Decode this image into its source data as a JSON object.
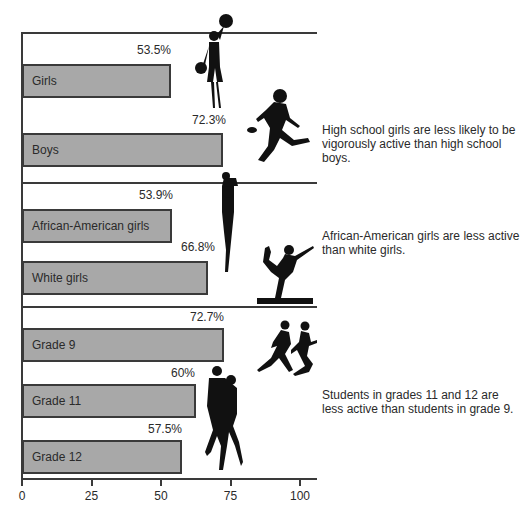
{
  "chart_data": {
    "type": "bar",
    "orientation": "horizontal",
    "title": "",
    "xlabel": "",
    "ylabel": "",
    "xlim": [
      0,
      105
    ],
    "x_ticks": [
      "0",
      "25",
      "50",
      "75",
      "100"
    ],
    "grid": false,
    "groups": [
      {
        "name": "Gender",
        "note": "High school girls are less likely to be vigorously active than high school boys.",
        "categories": [
          "Girls",
          "Boys"
        ],
        "values": [
          53.5,
          72.3
        ],
        "value_labels": [
          "53.5%",
          "72.3%"
        ]
      },
      {
        "name": "Race",
        "note": "African-American girls are less active than white girls.",
        "categories": [
          "African-American girls",
          "White girls"
        ],
        "values": [
          53.9,
          66.8
        ],
        "value_labels": [
          "53.9%",
          "66.8%"
        ]
      },
      {
        "name": "Grade",
        "note": "Students in grades 11 and 12 are less active than students in grade 9.",
        "categories": [
          "Grade 9",
          "Grade 11",
          "Grade 12"
        ],
        "values": [
          72.7,
          60,
          57.5
        ],
        "value_labels": [
          "72.7%",
          "60%",
          "57.5%"
        ]
      }
    ],
    "colors": {
      "bar_fill": "#a8a8a8",
      "bar_border": "#3a3a3a",
      "axis": "#3a3a3a"
    }
  },
  "bars": [
    {
      "label": "Girls",
      "value_label": "53.5%",
      "drawn": 53.5,
      "top": 64,
      "vtop": 43,
      "vx": 171
    },
    {
      "label": "Boys",
      "value_label": "72.3%",
      "drawn": 72.3,
      "top": 133,
      "vtop": 113,
      "vx": 226
    },
    {
      "label": "African-American girls",
      "value_label": "53.9%",
      "drawn": 53.9,
      "top": 209,
      "vtop": 188,
      "vx": 173
    },
    {
      "label": "White girls",
      "value_label": "66.8%",
      "drawn": 66.8,
      "top": 261,
      "vtop": 240,
      "vx": 215
    },
    {
      "label": "Grade 9",
      "value_label": "72.7%",
      "drawn": 72.7,
      "top": 328,
      "vtop": 310,
      "vx": 224
    },
    {
      "label": "Grade 11",
      "value_label": "60%",
      "drawn": 62.5,
      "top": 384,
      "vtop": 366,
      "vx": 195
    },
    {
      "label": "Grade 12",
      "value_label": "57.5%",
      "drawn": 57.5,
      "top": 440,
      "vtop": 422,
      "vx": 182
    }
  ],
  "notes": [
    {
      "text": "High school girls are less likely to be vigorously active than high school boys.",
      "top": 123
    },
    {
      "text": "African-American girls are less active than white girls.",
      "top": 229
    },
    {
      "text": "Students in grades 11 and 12 are less active than students in grade 9.",
      "top": 388
    }
  ],
  "axis": {
    "ticks": [
      "0",
      "25",
      "50",
      "75",
      "100"
    ]
  },
  "icons": [
    "cheerleader-silhouette",
    "football-player-silhouette",
    "basketball-player-silhouette",
    "gymnast-silhouette",
    "runners-silhouette",
    "dancing-couple-silhouette"
  ]
}
